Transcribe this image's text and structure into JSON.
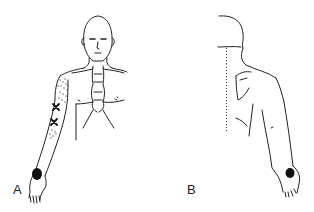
{
  "figure": {
    "panels": [
      {
        "id": "A",
        "label": "A",
        "view": "anterior",
        "description": "Front view of man with head, neck, chest, right arm with dotted area and X marks, shaded palm/wrist region"
      },
      {
        "id": "B",
        "label": "B",
        "view": "posterior",
        "description": "Back view of head, shoulder and arm with dotted spine line and shaded wrist region"
      }
    ],
    "colors": {
      "line": "#222222",
      "shading": "#111111",
      "background": "#ffffff"
    }
  }
}
